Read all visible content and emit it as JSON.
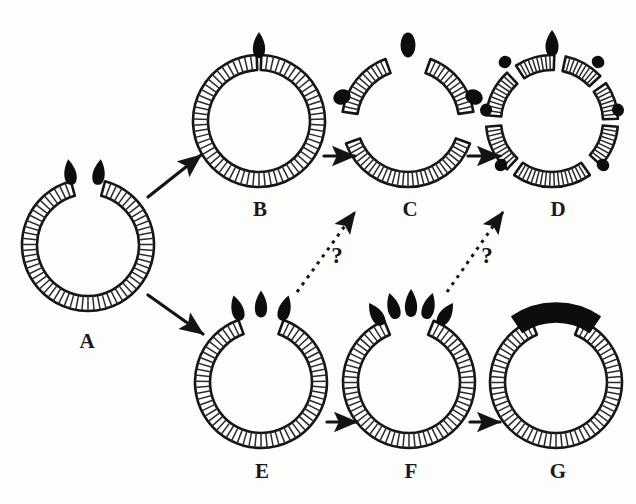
{
  "figure": {
    "background_color": "#fdfdfb",
    "ink_color": "#141414",
    "band_fill": "#ffffff",
    "hatch_color": "#2a2a2a",
    "blob_color": "#0d0d0d",
    "panel_count": 7
  },
  "panels": [
    {
      "id": "A",
      "label": "A",
      "label_x": 72,
      "label_y": 331,
      "center_x": 88,
      "center_y": 245,
      "outer_r": 66,
      "band_w": 15,
      "description": "C-shaped hatched ring with gap at top, two black teardrops above gap",
      "arcs": [
        {
          "start_deg": 285,
          "end_deg": 615,
          "hatch_n": 62
        }
      ],
      "blobs": [
        {
          "cx": 70,
          "cy": 172,
          "rx": 7.5,
          "ry": 13,
          "rot": -8,
          "shape": "teardrop"
        },
        {
          "cx": 99,
          "cy": 172,
          "rx": 7.5,
          "ry": 13,
          "rot": 8,
          "shape": "teardrop"
        }
      ]
    },
    {
      "id": "B",
      "label": "B",
      "label_x": 245,
      "label_y": 199,
      "center_x": 259,
      "center_y": 121,
      "outer_r": 66,
      "band_w": 15,
      "description": "Nearly closed hatched ring with narrow top gap and one black teardrop",
      "arcs": [
        {
          "start_deg": 272,
          "end_deg": 628,
          "hatch_n": 66
        }
      ],
      "blobs": [
        {
          "cx": 259,
          "cy": 45,
          "rx": 7.5,
          "ry": 13,
          "rot": 0,
          "shape": "teardrop"
        }
      ]
    },
    {
      "id": "C",
      "label": "C",
      "label_x": 395,
      "label_y": 199,
      "center_x": 408,
      "center_y": 121,
      "outer_r": 66,
      "band_w": 15,
      "description": "Ring split into three hatched arc segments with black ovals in the gaps",
      "arcs": [
        {
          "start_deg": 20,
          "end_deg": 160,
          "hatch_n": 30
        },
        {
          "start_deg": 188,
          "end_deg": 250,
          "hatch_n": 13
        },
        {
          "start_deg": 290,
          "end_deg": 352,
          "hatch_n": 13
        }
      ],
      "blobs": [
        {
          "cx": 408,
          "cy": 45,
          "rx": 7.5,
          "ry": 12.5,
          "rot": 0,
          "shape": "oval"
        },
        {
          "cx": 342,
          "cy": 97,
          "rx": 9,
          "ry": 7.5,
          "rot": -25,
          "shape": "oval"
        },
        {
          "cx": 474,
          "cy": 97,
          "rx": 9,
          "ry": 7.5,
          "rot": 25,
          "shape": "oval"
        }
      ]
    },
    {
      "id": "D",
      "label": "D",
      "label_x": 543,
      "label_y": 199,
      "center_x": 552,
      "center_y": 121,
      "outer_r": 66,
      "band_w": 15,
      "description": "Ring fully fragmented into seven hatched arc segments separated by small black ovals",
      "arcs": [
        {
          "start_deg": 55,
          "end_deg": 125,
          "hatch_n": 17
        },
        {
          "start_deg": 133,
          "end_deg": 175,
          "hatch_n": 10
        },
        {
          "start_deg": 185,
          "end_deg": 227,
          "hatch_n": 10
        },
        {
          "start_deg": 237,
          "end_deg": 272,
          "hatch_n": 9
        },
        {
          "start_deg": 282,
          "end_deg": 317,
          "hatch_n": 9
        },
        {
          "start_deg": 325,
          "end_deg": 358,
          "hatch_n": 8
        },
        {
          "start_deg": 5,
          "end_deg": 42,
          "hatch_n": 9
        }
      ],
      "blobs": [
        {
          "cx": 552,
          "cy": 43,
          "rx": 8,
          "ry": 13,
          "rot": 0,
          "shape": "teardrop"
        },
        {
          "cx": 505,
          "cy": 62,
          "rx": 6.5,
          "ry": 6,
          "rot": -35,
          "shape": "oval"
        },
        {
          "cx": 598,
          "cy": 62,
          "rx": 6.5,
          "ry": 6,
          "rot": 35,
          "shape": "oval"
        },
        {
          "cx": 486,
          "cy": 110,
          "rx": 6.5,
          "ry": 6,
          "rot": -70,
          "shape": "oval"
        },
        {
          "cx": 618,
          "cy": 110,
          "rx": 6.5,
          "ry": 6,
          "rot": 70,
          "shape": "oval"
        },
        {
          "cx": 501,
          "cy": 165,
          "rx": 6.5,
          "ry": 6,
          "rot": -40,
          "shape": "oval"
        },
        {
          "cx": 603,
          "cy": 165,
          "rx": 6.5,
          "ry": 6,
          "rot": 40,
          "shape": "oval"
        }
      ]
    },
    {
      "id": "E",
      "label": "E",
      "label_x": 247,
      "label_y": 461,
      "center_x": 261,
      "center_y": 382,
      "outer_r": 66,
      "band_w": 15,
      "description": "C-shaped hatched ring with gap at top and three black teardrops above gap",
      "arcs": [
        {
          "start_deg": 290,
          "end_deg": 610,
          "hatch_n": 60
        }
      ],
      "blobs": [
        {
          "cx": 237,
          "cy": 308,
          "rx": 7.5,
          "ry": 13,
          "rot": -16,
          "shape": "teardrop"
        },
        {
          "cx": 261,
          "cy": 304,
          "rx": 7.5,
          "ry": 13.5,
          "rot": 0,
          "shape": "teardrop"
        },
        {
          "cx": 285,
          "cy": 308,
          "rx": 7.5,
          "ry": 13,
          "rot": 16,
          "shape": "teardrop"
        }
      ]
    },
    {
      "id": "F",
      "label": "F",
      "label_x": 396,
      "label_y": 461,
      "center_x": 409,
      "center_y": 382,
      "outer_r": 66,
      "band_w": 15,
      "description": "C-shaped hatched ring with five black teardrops fanned in an arc above the gap",
      "arcs": [
        {
          "start_deg": 292,
          "end_deg": 608,
          "hatch_n": 60
        }
      ],
      "blobs": [
        {
          "cx": 376,
          "cy": 314,
          "rx": 7.5,
          "ry": 13,
          "rot": -32,
          "shape": "teardrop"
        },
        {
          "cx": 393,
          "cy": 306,
          "rx": 7.5,
          "ry": 13.5,
          "rot": -16,
          "shape": "teardrop"
        },
        {
          "cx": 411,
          "cy": 303,
          "rx": 7.5,
          "ry": 14,
          "rot": 0,
          "shape": "teardrop"
        },
        {
          "cx": 429,
          "cy": 306,
          "rx": 7.5,
          "ry": 13.5,
          "rot": 16,
          "shape": "teardrop"
        },
        {
          "cx": 446,
          "cy": 314,
          "rx": 7.5,
          "ry": 13,
          "rot": 32,
          "shape": "teardrop"
        }
      ]
    },
    {
      "id": "G",
      "label": "G",
      "label_x": 543,
      "label_y": 461,
      "center_x": 556,
      "center_y": 382,
      "outer_r": 66,
      "band_w": 15,
      "description": "C-shaped hatched ring capped by a single fused solid black crescent over the gap",
      "arcs": [
        {
          "start_deg": 292,
          "end_deg": 608,
          "hatch_n": 60
        }
      ],
      "cap": {
        "start_deg": 236,
        "end_deg": 304,
        "inner_r": 60,
        "outer_r": 79,
        "color": "#0d0d0d"
      },
      "blobs": []
    }
  ],
  "arrows": [
    {
      "id": "a-to-b",
      "from": "A",
      "to": "B",
      "style": "solid",
      "x1": 148,
      "y1": 197,
      "x2": 201,
      "y2": 155
    },
    {
      "id": "a-to-e",
      "from": "A",
      "to": "E",
      "style": "solid",
      "x1": 148,
      "y1": 295,
      "x2": 203,
      "y2": 334
    },
    {
      "id": "b-to-c",
      "from": "B",
      "to": "C",
      "style": "solid",
      "x1": 324,
      "y1": 156,
      "x2": 355,
      "y2": 156
    },
    {
      "id": "c-to-d",
      "from": "C",
      "to": "D",
      "style": "solid",
      "x1": 468,
      "y1": 156,
      "x2": 500,
      "y2": 156
    },
    {
      "id": "e-to-f",
      "from": "E",
      "to": "F",
      "style": "solid",
      "x1": 327,
      "y1": 422,
      "x2": 357,
      "y2": 422
    },
    {
      "id": "f-to-g",
      "from": "F",
      "to": "G",
      "style": "solid",
      "x1": 470,
      "y1": 422,
      "x2": 500,
      "y2": 422
    },
    {
      "id": "e-to-c-unknown",
      "from": "E",
      "to": "C",
      "style": "dashed",
      "x1": 297,
      "y1": 292,
      "x2": 355,
      "y2": 212,
      "label": "?"
    },
    {
      "id": "f-to-d-unknown",
      "from": "F",
      "to": "D",
      "style": "dashed",
      "x1": 447,
      "y1": 292,
      "x2": 503,
      "y2": 212,
      "label": "?"
    }
  ],
  "question_marks": [
    {
      "id": "q1",
      "text": "?",
      "x": 328,
      "y": 244
    },
    {
      "id": "q2",
      "text": "?",
      "x": 478,
      "y": 244
    }
  ]
}
